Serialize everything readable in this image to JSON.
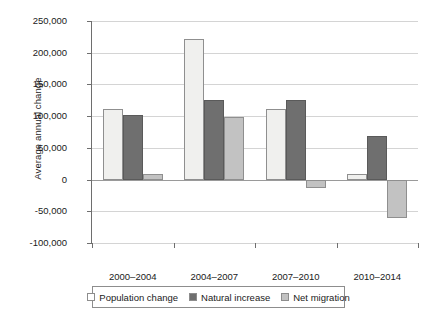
{
  "chart_data": {
    "type": "bar",
    "title": "",
    "xlabel": "",
    "ylabel": "Average annual change",
    "categories": [
      "2000–2004",
      "2004–2007",
      "2007–2010",
      "2010–2014"
    ],
    "series": [
      {
        "name": "Population change",
        "values": [
          111000,
          222000,
          112000,
          8000
        ],
        "color": "#f0f0ee"
      },
      {
        "name": "Natural increase",
        "values": [
          102000,
          125000,
          125000,
          68000
        ],
        "color": "#6f6f6f"
      },
      {
        "name": "Net migration",
        "values": [
          8000,
          99000,
          -14000,
          -61000
        ],
        "color": "#c2c2c2"
      }
    ],
    "ylim": [
      -100000,
      250000
    ],
    "yticks": [
      250000,
      200000,
      150000,
      100000,
      50000,
      0,
      -50000,
      -100000
    ],
    "ytick_labels": [
      "250,000",
      "200,000",
      "150,000",
      "100,000",
      "50,000",
      "0",
      "-50,000",
      "-100,000"
    ],
    "grid": true,
    "legend_position": "bottom"
  },
  "legend": {
    "items": [
      {
        "label": "Population change",
        "swatch": "legend-swatch-population-change"
      },
      {
        "label": "Natural increase",
        "swatch": "legend-swatch-natural-increase"
      },
      {
        "label": "Net migration",
        "swatch": "legend-swatch-net-migration"
      }
    ]
  }
}
